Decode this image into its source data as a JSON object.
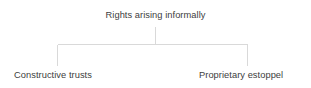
{
  "diagram": {
    "type": "tree",
    "background_color": "#ffffff",
    "line_color": "#d9d9d9",
    "text_color": "#404040",
    "root": {
      "label": "Rights arising informally"
    },
    "children": [
      {
        "label": "Constructive trusts"
      },
      {
        "label": "Proprietary estoppel"
      }
    ],
    "connector": {
      "stem_x": 155,
      "stem_top_y": 27,
      "bar_y": 44,
      "bar_left_x": 57,
      "bar_right_x": 247,
      "leg_bottom_y": 66
    }
  }
}
